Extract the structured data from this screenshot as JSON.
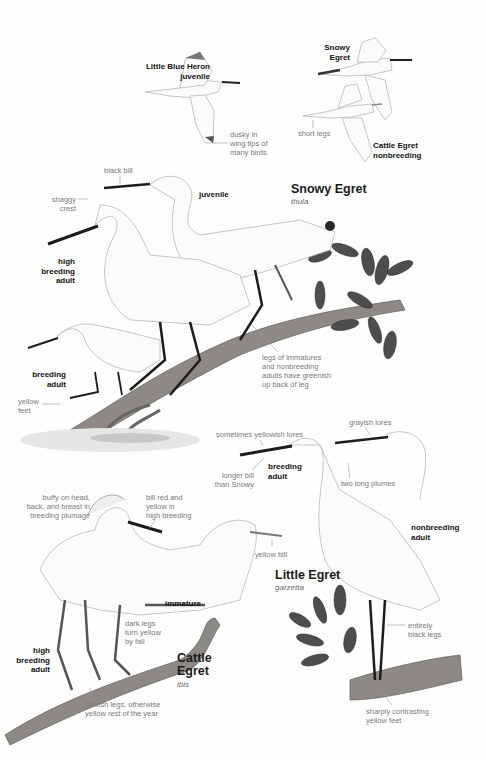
{
  "page": {
    "species": [
      {
        "name": "Snowy Egret",
        "subspecies": "thula"
      },
      {
        "name": "Little Egret",
        "subspecies": "garzetta"
      },
      {
        "name": "Cattle Egret",
        "subspecies": "ibis"
      }
    ],
    "flight_figures": {
      "little_blue_heron": {
        "label_line1": "Little Blue Heron",
        "label_line2": "juvenile",
        "note": [
          "dusky in",
          "wing tips of",
          "many birds"
        ]
      },
      "snowy_egret": {
        "label_line1": "Snowy",
        "label_line2": "Egret"
      },
      "cattle_egret": {
        "label_line1": "Cattle Egret",
        "label_line2": "nonbreeding",
        "note": "short legs"
      }
    },
    "snowy_section": {
      "notes": {
        "black_bill": "black bill",
        "shaggy_crest": [
          "shaggy",
          "crest"
        ],
        "legs": [
          "legs of immatures",
          "and nonbreeding",
          "adults have greenish",
          "up back of leg"
        ],
        "yellow_feet": [
          "yellow",
          "feet"
        ]
      },
      "labels": {
        "juvenile": "juvenile",
        "high_breeding": [
          "high",
          "breeding",
          "adult"
        ],
        "breeding": [
          "breeding",
          "adult"
        ]
      }
    },
    "little_egret_section": {
      "notes": {
        "yellowish_lores": "sometimes yellowish lores",
        "grayish_lores": "grayish lores",
        "longer_bill": [
          "longer bill",
          "than Snowy"
        ],
        "plumes": "two long plumes",
        "black_legs": [
          "entirely",
          "black legs"
        ],
        "yellow_feet": [
          "sharply contrasting",
          "yellow feet"
        ]
      },
      "labels": {
        "breeding": [
          "breeding",
          "adult"
        ],
        "nonbreeding": [
          "nonbreeding",
          "adult"
        ]
      }
    },
    "cattle_section": {
      "notes": {
        "buffy": [
          "buffy on head,",
          "back, and breast in",
          "breeding plumage"
        ],
        "bill": [
          "bill red and",
          "yellow in",
          "high breeding"
        ],
        "yellow_bill": "yellow bill",
        "dark_legs": [
          "dark legs",
          "turn yellow",
          "by fall"
        ],
        "pinkish_legs": [
          "pinkish legs, otherwise",
          "yellow rest of the year"
        ]
      },
      "labels": {
        "immature": "immature",
        "high_breeding": [
          "high",
          "breeding",
          "adult"
        ]
      }
    },
    "colors": {
      "label": "#111111",
      "note": "#7a7a7a",
      "bird_fill": "#fbfbfb",
      "bird_line": "#b8b8b8",
      "bill": "#1c1c1c",
      "branch": "#8a8480",
      "leaf": "#4a4a4a"
    }
  }
}
